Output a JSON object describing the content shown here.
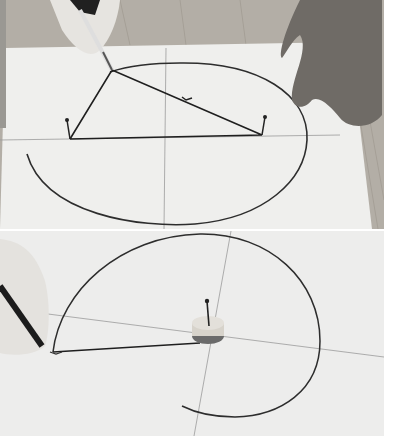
{
  "figure": {
    "panels": [
      {
        "id": "top",
        "description": "Drawing an ellipse using two pins and a loop of string with a pencil"
      },
      {
        "id": "bottom",
        "description": "Drawing a spiral with string unwinding from a spool held by a central pin"
      }
    ],
    "colors": {
      "paper": "#eeeeec",
      "line": "#2a2a2a",
      "wood": "#a9a49c",
      "background": "#ffffff"
    }
  }
}
